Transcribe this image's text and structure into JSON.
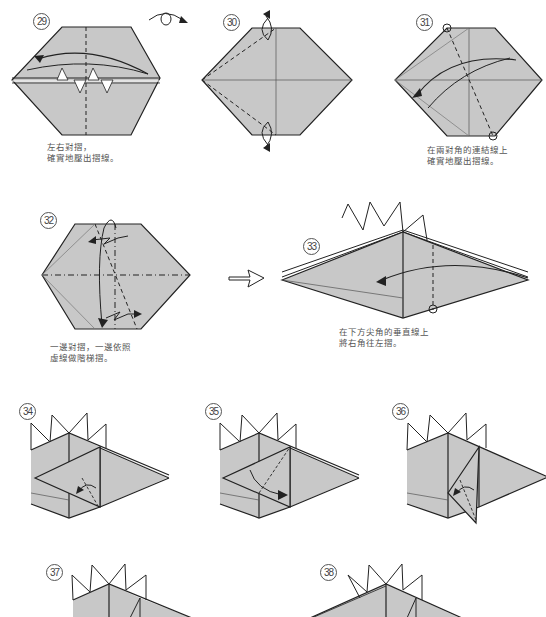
{
  "diagram": {
    "paper_color": "#c8c8c8",
    "line_color": "#222222",
    "steps": [
      {
        "number": "29",
        "caption_lines": [
          "左右對摺，",
          "確實地壓出摺線。"
        ]
      },
      {
        "number": "30",
        "caption_lines": []
      },
      {
        "number": "31",
        "caption_lines": [
          "在兩對角的連結線上",
          "確實地壓出摺線。"
        ]
      },
      {
        "number": "32",
        "caption_lines": [
          "一邊對摺，一邊依照",
          "虛線做階梯摺。"
        ]
      },
      {
        "number": "33",
        "caption_lines": [
          "在下方尖角的垂直線上",
          "將右角往左摺。"
        ]
      },
      {
        "number": "34",
        "caption_lines": []
      },
      {
        "number": "35",
        "caption_lines": []
      },
      {
        "number": "36",
        "caption_lines": []
      },
      {
        "number": "37",
        "caption_lines": []
      },
      {
        "number": "38",
        "caption_lines": []
      }
    ],
    "symbols": {
      "turn_over": "turn-over-icon",
      "next_arrow": "hollow-right-arrow-icon"
    }
  }
}
